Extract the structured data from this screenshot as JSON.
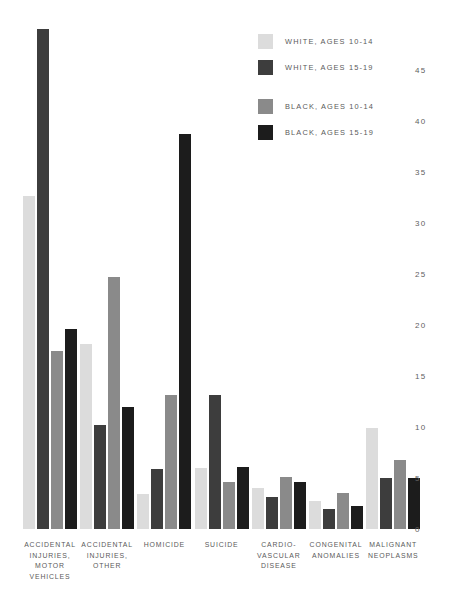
{
  "chart_data": {
    "type": "bar",
    "title": "",
    "subtitle": "",
    "xlabel": "",
    "ylabel": "",
    "ylim": [
      0,
      45
    ],
    "ytick_step": 5,
    "yticks": [
      "0",
      "5",
      "10",
      "15",
      "20",
      "25",
      "30",
      "35",
      "40",
      "45"
    ],
    "grid": false,
    "legend_position": "top-right",
    "categories": [
      "ACCIDENTAL INJURIES, MOTOR VEHICLES",
      "ACCIDENTAL INJURIES, OTHER",
      "HOMICIDE",
      "SUICIDE",
      "CARDIO-VASCULAR DISEASE",
      "CONGENITAL ANOMALIES",
      "MALIGNANT NEOPLASMS"
    ],
    "category_lines": [
      [
        "ACCIDENTAL",
        "INJURIES,",
        "MOTOR",
        "VEHICLES"
      ],
      [
        "ACCIDENTAL",
        "INJURIES,",
        "OTHER"
      ],
      [
        "HOMICIDE"
      ],
      [
        "SUICIDE"
      ],
      [
        "CARDIO-",
        "VASCULAR",
        "DISEASE"
      ],
      [
        "CONGENITAL",
        "ANOMALIES"
      ],
      [
        "MALIGNANT",
        "NEOPLASMS"
      ]
    ],
    "series": [
      {
        "name": "WHITE, AGES 10-14",
        "color": "#dcdcdc",
        "values": [
          32.6,
          18.1,
          3.4,
          6.0,
          4.0,
          2.7,
          9.9
        ]
      },
      {
        "name": "WHITE, AGES 15-19",
        "color": "#3d3d3d",
        "values": [
          49.0,
          10.2,
          5.9,
          13.1,
          3.1,
          2.0,
          5.0
        ]
      },
      {
        "name": "BLACK, AGES 10-14",
        "color": "#8a8a8a",
        "values": [
          17.5,
          24.7,
          13.1,
          4.6,
          5.1,
          3.5,
          6.8
        ]
      },
      {
        "name": "BLACK, AGES 15-19",
        "color": "#1c1c1c",
        "values": [
          19.6,
          12.0,
          38.7,
          6.1,
          4.6,
          2.3,
          5.0
        ]
      }
    ]
  },
  "legend": {
    "entries": [
      {
        "label": "WHITE, AGES 10-14",
        "color": "#dcdcdc"
      },
      {
        "label": "WHITE, AGES 15-19",
        "color": "#3d3d3d"
      },
      {
        "label": "BLACK, AGES 10-14",
        "color": "#8a8a8a"
      },
      {
        "label": "BLACK, AGES 15-19",
        "color": "#1c1c1c"
      }
    ]
  }
}
